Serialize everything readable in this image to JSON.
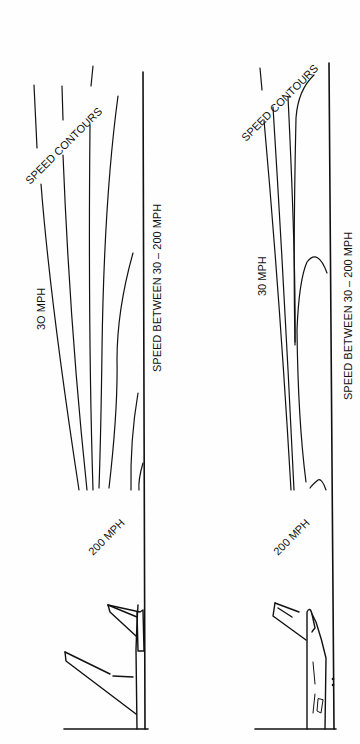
{
  "figure": {
    "orientation": "rotated-90-ccw",
    "ink_color": "#111111",
    "background_color": "#fefefe",
    "panels": [
      {
        "id": "panel-left",
        "labels": {
          "contours": "SPEED CONTOURS",
          "low_speed": "3O MPH",
          "high_speed": "200 MPH",
          "range_note": "SPEED BETWEEN 30 – 200 MPH"
        },
        "aircraft_state": "wing and tail, flaps retracted"
      },
      {
        "id": "panel-right",
        "labels": {
          "contours": "SPEED CONTOURS",
          "low_speed": "30 MPH",
          "high_speed": "200 MPH",
          "range_note": "SPEED BETWEEN 30 – 200 MPH"
        },
        "aircraft_state": "wing and fuselage with cockpit detail"
      }
    ]
  }
}
